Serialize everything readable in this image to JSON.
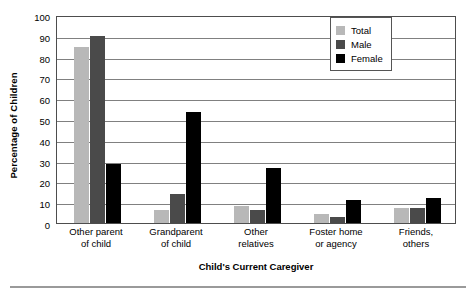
{
  "chart_data": {
    "type": "bar",
    "title": "",
    "xlabel": "Child's Current Caregiver",
    "ylabel": "Percentage of Children",
    "categories": [
      "Other parent of child",
      "Grandparent of child",
      "Other relatives",
      "Foster home or agency",
      "Friends, others"
    ],
    "category_lines": [
      [
        "Other parent",
        "of child"
      ],
      [
        "Grandparent",
        "of child"
      ],
      [
        "Other",
        "relatives"
      ],
      [
        "Foster home",
        "or agency"
      ],
      [
        "Friends,",
        "others"
      ]
    ],
    "series": [
      {
        "name": "Total",
        "color": "#b8b8b8",
        "values": [
          84.5,
          6.2,
          8.0,
          4.2,
          7.0
        ]
      },
      {
        "name": "Male",
        "color": "#4a4a4a",
        "values": [
          90.0,
          14.0,
          6.2,
          3.0,
          7.2
        ]
      },
      {
        "name": "Female",
        "color": "#000000",
        "values": [
          28.5,
          53.5,
          26.3,
          11.0,
          12.0
        ]
      }
    ],
    "ylim": [
      0,
      100
    ],
    "ytick_values": [
      0,
      10,
      20,
      30,
      40,
      50,
      60,
      70,
      80,
      90,
      100
    ],
    "ytick_labels": [
      "0",
      "10",
      "20",
      "30",
      "40",
      "50",
      "60",
      "70",
      "80",
      "90",
      "100"
    ],
    "grid": true,
    "grid_axis": "y",
    "legend_position": "top-right",
    "legend_entries": [
      "Total",
      "Male",
      "Female"
    ]
  },
  "colors": {
    "total": "#b8b8b8",
    "male": "#4a4a4a",
    "female": "#000000",
    "gridline": "#808080",
    "axis": "#4d4d4d",
    "rule": "#9a9a9a"
  }
}
